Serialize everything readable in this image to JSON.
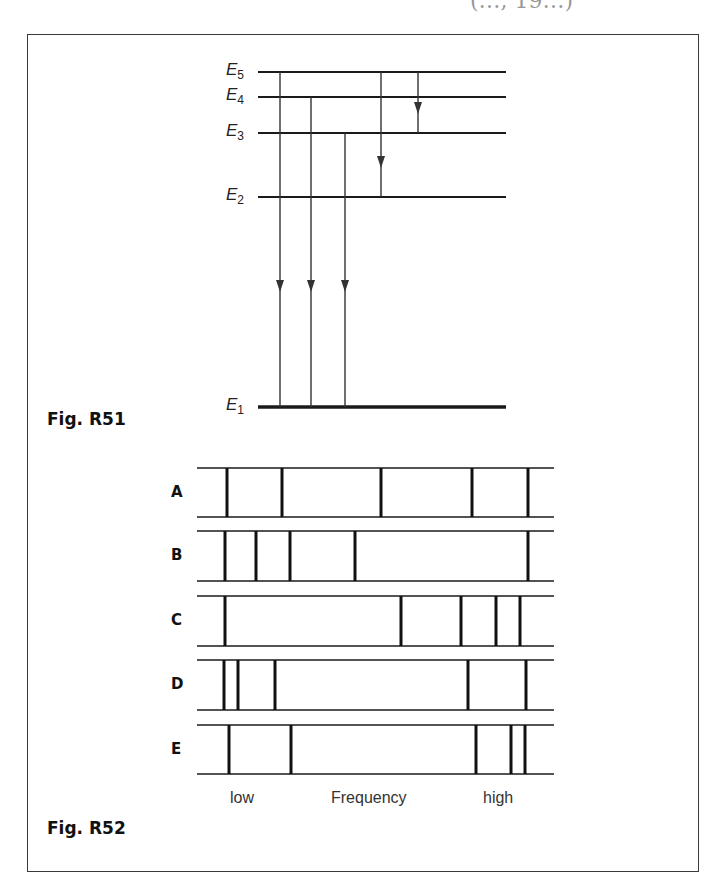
{
  "header": {
    "citation_fragment": "(…, 19…)"
  },
  "fig_r51": {
    "caption": "Fig. R51",
    "levels": [
      {
        "name": "E5",
        "base": "E",
        "sub": "5",
        "y": 72
      },
      {
        "name": "E4",
        "base": "E",
        "sub": "4",
        "y": 97
      },
      {
        "name": "E3",
        "base": "E",
        "sub": "3",
        "y": 133
      },
      {
        "name": "E2",
        "base": "E",
        "sub": "2",
        "y": 197
      },
      {
        "name": "E1",
        "base": "E",
        "sub": "1",
        "y": 407
      }
    ],
    "level_x_start": 258,
    "level_x_end": 506,
    "transitions": [
      {
        "from": "E5",
        "to": "E1",
        "x": 280,
        "arrow_y": 286
      },
      {
        "from": "E4",
        "to": "E1",
        "x": 311,
        "arrow_y": 286
      },
      {
        "from": "E3",
        "to": "E1",
        "x": 345,
        "arrow_y": 286
      },
      {
        "from": "E5",
        "to": "E2",
        "x": 381,
        "arrow_y": 162
      },
      {
        "from": "E5",
        "to": "E3",
        "x": 418,
        "arrow_y": 108
      }
    ]
  },
  "fig_r52": {
    "caption": "Fig. R52",
    "strip_x_start": 197,
    "strip_x_end": 554,
    "spectra": [
      {
        "label": "A",
        "top": 468,
        "bottom": 517,
        "lines": [
          227,
          282,
          381,
          472,
          528
        ]
      },
      {
        "label": "B",
        "top": 531,
        "bottom": 581,
        "lines": [
          225,
          256,
          290,
          355,
          528
        ]
      },
      {
        "label": "C",
        "top": 596,
        "bottom": 646,
        "lines": [
          225,
          401,
          461,
          496,
          520
        ]
      },
      {
        "label": "D",
        "top": 660,
        "bottom": 710,
        "lines": [
          224,
          238,
          275,
          468,
          526
        ]
      },
      {
        "label": "E",
        "top": 725,
        "bottom": 774,
        "lines": [
          229,
          291,
          476,
          511,
          525
        ]
      }
    ],
    "axis": {
      "low": "low",
      "title": "Frequency",
      "high": "high"
    }
  }
}
